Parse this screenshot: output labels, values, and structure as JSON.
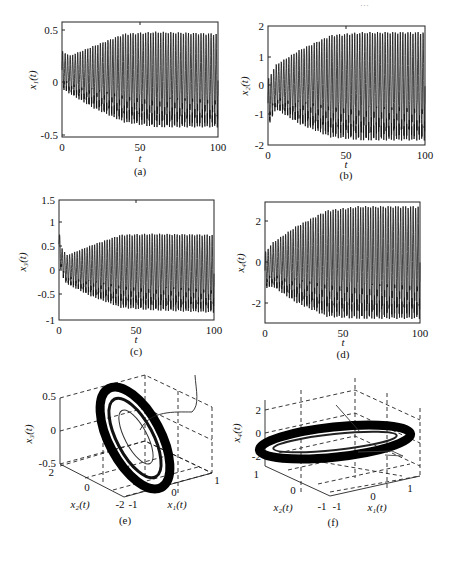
{
  "header": {
    "text": "…"
  },
  "chart_data": [
    {
      "id": "a",
      "type": "line",
      "caption": "(a)",
      "xlabel": "t",
      "ylabel": "x₁(t)",
      "xlim": [
        0,
        100
      ],
      "ylim": [
        -0.6,
        0.6
      ],
      "xticks": [
        "0",
        "50",
        "100"
      ],
      "yticks": [
        "-0.5",
        "0",
        "0.5"
      ],
      "description": "Oscillation growing from amplitude ~0.25 to ~0.5 by t≈40, then steady",
      "envelope": {
        "t": [
          0,
          5,
          20,
          40,
          60,
          100
        ],
        "upper": [
          0.3,
          0.25,
          0.35,
          0.48,
          0.5,
          0.48
        ],
        "lower": [
          -0.1,
          -0.15,
          -0.3,
          -0.45,
          -0.5,
          -0.5
        ]
      }
    },
    {
      "id": "b",
      "type": "line",
      "caption": "(b)",
      "xlabel": "t",
      "ylabel": "x₂(t)",
      "xlim": [
        0,
        100
      ],
      "ylim": [
        -2,
        2
      ],
      "xticks": [
        "0",
        "50",
        "100"
      ],
      "yticks": [
        "-2",
        "-1",
        "0",
        "1",
        "2"
      ],
      "envelope": {
        "t": [
          0,
          5,
          20,
          40,
          60,
          100
        ],
        "upper": [
          0.2,
          0.7,
          1.2,
          1.7,
          1.8,
          1.8
        ],
        "lower": [
          -1.4,
          -0.8,
          -1.3,
          -1.75,
          -1.85,
          -1.85
        ]
      }
    },
    {
      "id": "c",
      "type": "line",
      "caption": "(c)",
      "xlabel": "t",
      "ylabel": "x₃(t)",
      "xlim": [
        0,
        100
      ],
      "ylim": [
        -1,
        1.5
      ],
      "xticks": [
        "0",
        "50",
        "100"
      ],
      "yticks": [
        "-1",
        "-0.5",
        "0",
        "0.5",
        "1",
        "1.5"
      ],
      "envelope": {
        "t": [
          0,
          2,
          5,
          20,
          40,
          60,
          100
        ],
        "upper": [
          0.85,
          0.5,
          0.35,
          0.55,
          0.78,
          0.8,
          0.78
        ],
        "lower": [
          0.3,
          -0.1,
          -0.25,
          -0.5,
          -0.75,
          -0.8,
          -0.85
        ]
      }
    },
    {
      "id": "d",
      "type": "line",
      "caption": "(d)",
      "xlabel": "t",
      "ylabel": "x₄(t)",
      "xlim": [
        0,
        100
      ],
      "ylim": [
        -3,
        3
      ],
      "xticks": [
        "0",
        "50",
        "100"
      ],
      "yticks": [
        "-2",
        "0",
        "2"
      ],
      "envelope": {
        "t": [
          0,
          5,
          20,
          40,
          60,
          100
        ],
        "upper": [
          0.5,
          1.0,
          1.8,
          2.6,
          2.8,
          2.8
        ],
        "lower": [
          -1.3,
          -1.2,
          -2.0,
          -2.7,
          -2.8,
          -2.8
        ]
      }
    },
    {
      "id": "e",
      "type": "scatter3d",
      "caption": "(e)",
      "xlabel": "x₁(t)",
      "ylabel": "x₂(t)",
      "zlabel": "x₃(t)",
      "xticks": [
        "-1",
        "0",
        "1"
      ],
      "yticks": [
        "-2",
        "0",
        "2"
      ],
      "zticks": [
        "-0.5",
        "0",
        "0.5"
      ],
      "description": "Phase portrait: tilted elliptical limit cycle in x1-x2-x3 space"
    },
    {
      "id": "f",
      "type": "scatter3d",
      "caption": "(f)",
      "xlabel": "x₁(t)",
      "ylabel": "x₂(t)",
      "zlabel": "x₄(t)",
      "xticks": [
        "-1",
        "0",
        "1"
      ],
      "yticks": [
        "-1",
        "0",
        "1"
      ],
      "zticks": [
        "-2",
        "0",
        "2"
      ],
      "description": "Phase portrait: flat elliptical limit cycle in x1-x2-x4 space"
    }
  ],
  "panels": {
    "a": {
      "caption": "(a)",
      "xlabel": "t",
      "ylabel": "x₁(t)",
      "xt": [
        "0",
        "50",
        "100"
      ],
      "yt": [
        "0.5",
        "0",
        "-0.5"
      ]
    },
    "b": {
      "caption": "(b)",
      "xlabel": "t",
      "ylabel": "x₂(t)",
      "xt": [
        "0",
        "50",
        "100"
      ],
      "yt": [
        "2",
        "1",
        "0",
        "-1",
        "-2"
      ]
    },
    "c": {
      "caption": "(c)",
      "xlabel": "t",
      "ylabel": "x₃(t)",
      "xt": [
        "0",
        "50",
        "100"
      ],
      "yt": [
        "1.5",
        "1",
        "0.5",
        "0",
        "-0.5",
        "-1"
      ]
    },
    "d": {
      "caption": "(d)",
      "xlabel": "t",
      "ylabel": "x₄(t)",
      "xt": [
        "0",
        "50",
        "100"
      ],
      "yt": [
        "2",
        "0",
        "-2"
      ]
    },
    "e": {
      "caption": "(e)",
      "xlabel": "x₁(t)",
      "ylabel": "x₂(t)",
      "zlabel": "x₃(t)",
      "xt": [
        "-1",
        "0",
        "1"
      ],
      "yt": [
        "2",
        "0",
        "-2"
      ],
      "zt": [
        "0.5",
        "0",
        "-0.5"
      ]
    },
    "f": {
      "caption": "(f)",
      "xlabel": "x₁(t)",
      "ylabel": "x₂(t)",
      "zlabel": "x₄(t)",
      "xt": [
        "-1",
        "0",
        "1"
      ],
      "yt": [
        "1",
        "0",
        "-1"
      ],
      "zt": [
        "2",
        "0",
        "-2"
      ]
    }
  }
}
